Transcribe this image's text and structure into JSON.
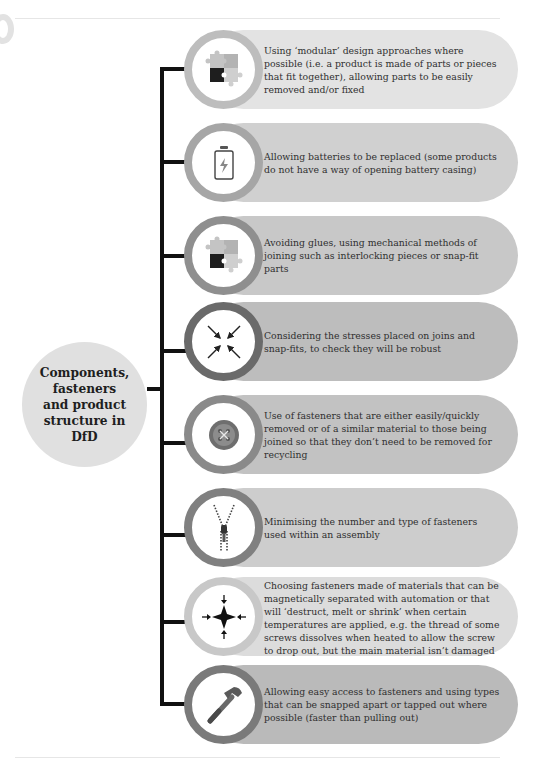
{
  "diagram": {
    "hub": {
      "title": "Components,\nfasteners\nand product\nstructure in DfD",
      "color": "#e0e0e0"
    },
    "connector_color": "#111111",
    "items": [
      {
        "icon": "puzzle-icon",
        "text": "Using ‘modular’ design approaches where possible (i.e. a product is made of parts or pieces that fit together), allowing parts to be easily removed and/or fixed",
        "pill_color": "#e3e3e3",
        "ring_color": "#bdbdbd"
      },
      {
        "icon": "battery-icon",
        "text": "Allowing batteries to be replaced (some products do not have a way of opening battery casing)",
        "pill_color": "#d0d0d0",
        "ring_color": "#a6a6a6"
      },
      {
        "icon": "puzzle-icon",
        "text": "Avoiding glues, using mechanical methods of joining such as interlocking pieces or snap-fit parts",
        "pill_color": "#c8c8c8",
        "ring_color": "#8f8f8f"
      },
      {
        "icon": "stress-arrows-icon",
        "text": "Considering the stresses placed on joins and snap-fits, to check they will be robust",
        "pill_color": "#bdbdbd",
        "ring_color": "#6a6a6a"
      },
      {
        "icon": "button-fastener-icon",
        "text": "Use of fasteners that are either easily/quickly removed or of a similar material to those being joined so that they don’t need to be removed for recycling",
        "pill_color": "#c2c2c2",
        "ring_color": "#8a8a8a"
      },
      {
        "icon": "zipper-icon",
        "text": "Minimising the number and type of fasteners used within an assembly",
        "pill_color": "#cdcdcd",
        "ring_color": "#808080"
      },
      {
        "icon": "implode-star-icon",
        "text": "Choosing fasteners made of materials that can be magnetically separated with automation or that will ‘destruct, melt or shrink’ when certain temperatures are applied, e.g. the thread of some screws dissolves when heated to allow the screw to drop out, but the main material isn’t damaged",
        "pill_color": "#dcdcdc",
        "ring_color": "#c8c8c8"
      },
      {
        "icon": "hammer-icon",
        "text": "Allowing easy access to fasteners and using types that can be snapped apart or tapped out where possible (faster than pulling out)",
        "pill_color": "#bababa",
        "ring_color": "#7a7a7a"
      }
    ]
  }
}
